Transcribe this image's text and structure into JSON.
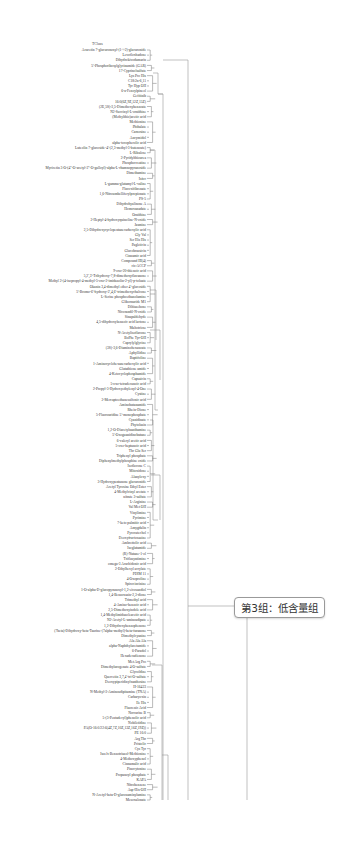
{
  "figure": {
    "type": "dendrogram",
    "top_label": "TCluss",
    "callout": {
      "text": "第3组：低含量组"
    }
  },
  "labels": [
    "Acacetin 7-glucuronosyl-(1->2)-glucuronide",
    "Levofloxhadone",
    "Dihydrokivodumarin",
    "5'-Phosphoribosylglycinamide (GAR)",
    "17-Cyprinolsulfate",
    "Lys Pro His",
    "C18:2n-6,11",
    "Tyr Hyp OH",
    "6-a-Fenoylpineol",
    "Gefitinib",
    "16:0(6Z,9Z,12Z,15Z)",
    "(2E,5S)-3,5-Dimethoxybenzoate",
    "N2-Succinyl-L-ornithine",
    "(Methylthio)acetic acid",
    "Methionine",
    "Phthalate",
    "Carnosine",
    "Ancymidol",
    "alpha-tocopherolic acid",
    "Luteolin 7-glucoside-4'-(2,3-methyl-3-butenoate)",
    "L-Ribulose",
    "2-Pyridylthiourea",
    "Phosphocreatine",
    "Myricetin 3-O-(4''-O-acetyl-2''-O-galloyl)-alpha-L-rhamnopyranoside",
    "Dimethamine",
    "Isfoc",
    "L-gamma-glutamyl-L-valine",
    "Flavoxifibrenate",
    "1,6-Nitroumbelliferylpropionate",
    "PS-5",
    "Dihydrohyalinone A",
    "Homovanadate",
    "Ornithine",
    "2-Heptyl-4-hydroxyquinoline-N-oxide",
    "Jasmine",
    "2,5-Dihydroxycyclopentanecarboxylic acid",
    "Gly Val",
    "Ser His His",
    "Pagleticin",
    "Glucobrassicin",
    "Cinnamic acid",
    "Compound III(4)",
    "cis-ACCP",
    "9-oxo-20-thienoic acid",
    "5,2',3'-Trihydroxy-7,8-dimethoxyflavanone",
    "Methyl 2-(4-isopropyl-4-methyl-5-oxo-2-imidazolin-2-yl)-p-toluate",
    "Okanin 3,4-dimethyl ether 4'-glucoside",
    "5'-Bromo-6'-hydroxy-2',4,6'-trimethoxychalcone",
    "L-Serine phosphoethanolamine",
    "Glibornuride M1",
    "Diltiazehone",
    "Nicorandil-N-oxide",
    "Sinapaldehyde",
    "4,5-dihydroxybenzoic acid lactone",
    "Maltotriose",
    "N-Acetylisoflavone",
    "BoPhe Tyr-OH",
    "Caprylylglycine",
    "(3S)-3,6-Diaminohexanoate",
    "Aphyllidine",
    "Baptifoline",
    "1-Aminocyclohexanecarboxylic acid",
    "Glutathione amide",
    "4-Ketocyclophosphamide",
    "Capsaicin",
    "5-oxo-tetradecanoic acid",
    "2-Propyl-3-Hydroxyethylenyl-4-One",
    "Cystine",
    "2-Mercaptoethanesulfonic acid",
    "Aminobutanamide",
    "Rhein-Dione",
    "5-Fluorouridine 5'-monophosphate",
    "Cyanidinate",
    "Phytolasin",
    "1,2-O-Diacetylnanthamine",
    "5'-Oxoguanidinobutane",
    "6-valeryl acetic acid",
    "5-oxo-heptanoic acid",
    "Thr Glu Ser",
    "Triphenyl phosphate",
    "Diphenylmethylphosphine oxide",
    "Isoflavone C",
    "Mitoxidone",
    "Alanyloxy",
    "3-Hydroxypentanone glucuronide",
    "Acetyl Tyrosine Ethyl Ester",
    "4-Methylvinyl acetate",
    "nitrate 3-sulfate",
    "L-Arginine",
    "Val Met OH",
    "Vinylimine",
    "Pyrimine",
    "7-keto palmitic acid",
    "Amygdalin",
    "Pyrocatechol",
    "Deoxyfructosazine",
    "Ambrettolic acid",
    "Isoglutamide",
    "(R)-Nutane-1-ol",
    "Triflusyntimine",
    "omega-3 Arachidonic acid",
    "2-Ethylhexyl acrylate",
    "PDIM 11",
    "4-Oxoproline",
    "Spirocincinine",
    "1-O-alpha-D-glucopyranosyl-1,2-eicosandiol",
    "1,4-Benzoxazin-2,3-dione",
    "Trimethyl acid",
    "4-Amino-benzoic acid",
    "2,5-Dimethoxyindole acid",
    "1,4-Methylimidazoleacetic acid",
    "N2-Acetyl-L-aminoadipate",
    "1,2-Dihydroxybenzophenone",
    "(7beta)-Dihydroxy-beta-Taurine-(7alpha-methyl)-beta-furanone",
    "Dimethylcyanine",
    "Ala Ala Ala",
    "alpha-Naphthylacetamide",
    "6-Paradol",
    "Hexadecadienone",
    "Met Arg Pro",
    "Dimethylurogenate 4-O-sulfate",
    "Glycoldine",
    "Quercetin 3,7,4'-tri-O-sulfate",
    "Deoxypiperidinylxanthosine",
    "H-16423",
    "N-Methyl-3-Aminoadipitamine (TNA)",
    "Carbaryoxin",
    "Ile His",
    "Fluorenic Acid",
    "Norcurine B",
    "5-(3-Pentadecyl)phenolic acid",
    "Nobiletidine",
    "PA(O-16:0/22:6(4Z,7Z,10Z,13Z,16Z,19Z))",
    "PE 16:0",
    "Arg Thr",
    "Pristolic",
    "Cys Tyr",
    "Isoelv Benzotriazol-Methionine",
    "4-Methoxyphenol",
    "Cinnamalic acid",
    "Pinocytonine",
    "Propanoyl phosphate",
    "KAPA",
    "Nitrobenzene",
    "Asp-His-OH",
    "N-Acetyl-beta-D-glucosaminylamine",
    "Mesoxalonate"
  ]
}
